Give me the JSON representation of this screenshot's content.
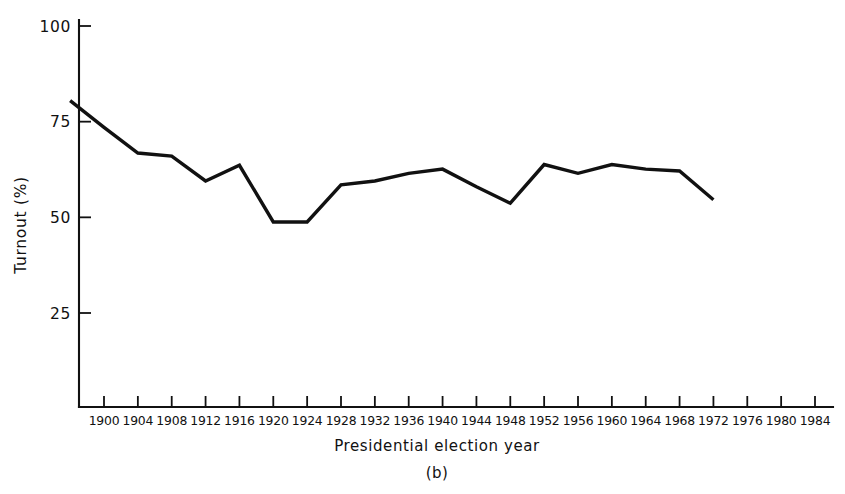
{
  "figure": {
    "panel_label": "(b)",
    "background_color": "#ffffff",
    "ink_color": "#111111"
  },
  "chart_data": {
    "type": "line",
    "title": "",
    "subtitle": "",
    "xlabel": "Presidential election year",
    "ylabel": "Turnout (%)",
    "xlim": [
      1896,
      1986
    ],
    "ylim": [
      0,
      103
    ],
    "grid": false,
    "legend": "none",
    "annotations": [
      "(b)"
    ],
    "y_ticks": [
      25,
      50,
      75,
      100
    ],
    "y_tick_labels": [
      "25",
      "50",
      "75",
      "100"
    ],
    "x_ticks": [
      1900,
      1904,
      1908,
      1912,
      1916,
      1920,
      1924,
      1928,
      1932,
      1936,
      1940,
      1944,
      1948,
      1952,
      1956,
      1960,
      1964,
      1968,
      1972,
      1976,
      1980,
      1984
    ],
    "x_tick_labels": [
      "1900",
      "1904",
      "1908",
      "1912",
      "1916",
      "1920",
      "1924",
      "1928",
      "1932",
      "1936",
      "1940",
      "1944",
      "1948",
      "1952",
      "1956",
      "1960",
      "1964",
      "1968",
      "1972",
      "1976",
      "1980",
      "1984"
    ],
    "series": [
      {
        "name": "Voter turnout",
        "color": "#111111",
        "x": [
          1896,
          1900,
          1904,
          1908,
          1912,
          1916,
          1920,
          1924,
          1928,
          1932,
          1936,
          1940,
          1944,
          1948,
          1952,
          1956,
          1960,
          1964,
          1968,
          1972
        ],
        "values": [
          80.5,
          73.5,
          66.8,
          66.0,
          59.5,
          63.6,
          48.8,
          48.8,
          58.5,
          59.5,
          61.5,
          62.6,
          58.0,
          53.7,
          63.8,
          61.5,
          63.8,
          62.6,
          62.1,
          54.6
        ]
      }
    ]
  }
}
